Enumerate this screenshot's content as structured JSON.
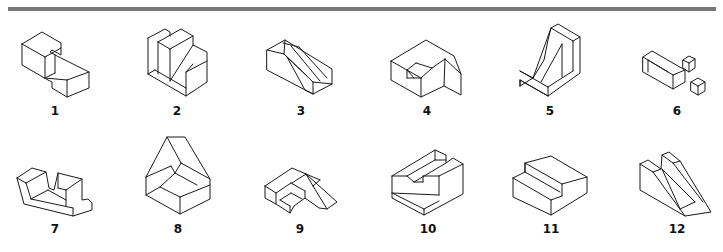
{
  "figure": {
    "type": "isometric-object-exercise",
    "rule_color": "#777777",
    "line_color": "#1a1a1a",
    "items": [
      {
        "id": "1",
        "label": "1"
      },
      {
        "id": "2",
        "label": "2"
      },
      {
        "id": "3",
        "label": "3"
      },
      {
        "id": "4",
        "label": "4"
      },
      {
        "id": "5",
        "label": "5"
      },
      {
        "id": "6",
        "label": "6"
      },
      {
        "id": "7",
        "label": "7"
      },
      {
        "id": "8",
        "label": "8"
      },
      {
        "id": "9",
        "label": "9"
      },
      {
        "id": "10",
        "label": "10"
      },
      {
        "id": "11",
        "label": "11"
      },
      {
        "id": "12",
        "label": "12"
      }
    ]
  }
}
